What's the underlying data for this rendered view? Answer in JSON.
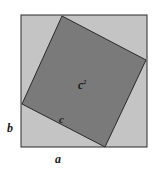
{
  "diagram": {
    "title": "",
    "colors": {
      "outer_fill": "#c4c4c4",
      "inner_fill": "#7a7a7a",
      "stroke": "#2a2a2a",
      "background": "#ffffff"
    },
    "outer_square": {
      "x": 21,
      "y": 15,
      "size": 126
    },
    "inner_square": {
      "points": "62,16 146,60 105,147 22,104"
    },
    "labels": {
      "area": "c",
      "area_exp": "2",
      "hypotenuse": "c",
      "side_b": "b",
      "side_a": "a"
    }
  }
}
